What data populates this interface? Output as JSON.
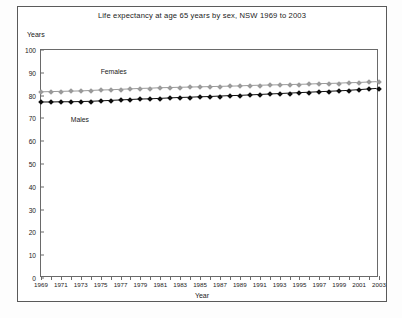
{
  "chart_data": {
    "type": "line",
    "title": "Life expectancy at age 65 years by sex, NSW 1969 to 2003",
    "xlabel": "Year",
    "ylabel": "Years",
    "ylim": [
      0,
      100
    ],
    "ytick_step": 10,
    "yticks": [
      "100",
      "90",
      "80",
      "70",
      "60",
      "50",
      "40",
      "30",
      "20",
      "10",
      "0"
    ],
    "xlim": [
      1969,
      2003
    ],
    "grid": false,
    "legend_position": "inline-annotation",
    "x": [
      1969,
      1970,
      1971,
      1972,
      1973,
      1974,
      1975,
      1976,
      1977,
      1978,
      1979,
      1980,
      1981,
      1982,
      1983,
      1984,
      1985,
      1986,
      1987,
      1988,
      1989,
      1990,
      1991,
      1992,
      1993,
      1994,
      1995,
      1996,
      1997,
      1998,
      1999,
      2000,
      2001,
      2002,
      2003
    ],
    "xtick_labels": [
      "1969",
      "1971",
      "1973",
      "1975",
      "1977",
      "1979",
      "1981",
      "1983",
      "1985",
      "1987",
      "1989",
      "1991",
      "1993",
      "1995",
      "1997",
      "1999",
      "2001",
      "2003"
    ],
    "series": [
      {
        "name": "Females",
        "color": "#9a9a9a",
        "marker": "diamond",
        "label_x": 1975,
        "label_y": 92,
        "values": [
          81.5,
          81.6,
          81.7,
          81.8,
          81.9,
          82.1,
          82.3,
          82.4,
          82.6,
          82.8,
          83.0,
          83.1,
          83.3,
          83.4,
          83.5,
          83.6,
          83.7,
          83.8,
          83.9,
          84.0,
          84.1,
          84.3,
          84.4,
          84.5,
          84.6,
          84.7,
          84.8,
          84.9,
          85.1,
          85.2,
          85.3,
          85.5,
          85.6,
          85.8,
          86.0
        ]
      },
      {
        "name": "Males",
        "color": "#0d0d0d",
        "marker": "diamond",
        "label_x": 1972,
        "label_y": 71,
        "values": [
          77.0,
          77.0,
          77.1,
          77.1,
          77.2,
          77.3,
          77.5,
          77.7,
          77.9,
          78.1,
          78.3,
          78.4,
          78.6,
          78.8,
          79.0,
          79.1,
          79.3,
          79.4,
          79.6,
          79.8,
          79.9,
          80.1,
          80.3,
          80.5,
          80.7,
          80.9,
          81.1,
          81.3,
          81.5,
          81.7,
          81.9,
          82.1,
          82.4,
          82.7,
          83.0
        ]
      }
    ]
  }
}
